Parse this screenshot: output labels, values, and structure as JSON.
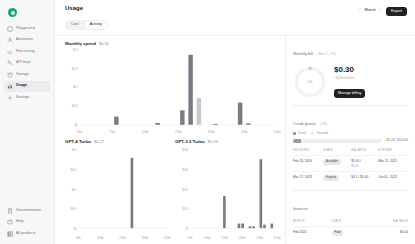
{
  "sidebar": {
    "logo_name": "openai-logo",
    "items": [
      {
        "label": "Playground",
        "icon": "playground-icon",
        "active": false
      },
      {
        "label": "Assistants",
        "icon": "assistants-icon",
        "active": false
      },
      {
        "label": "Fine-tuning",
        "icon": "fine-tuning-icon",
        "active": false
      },
      {
        "label": "API keys",
        "icon": "api-keys-icon",
        "active": false
      },
      {
        "label": "Storage",
        "icon": "storage-icon",
        "active": false
      },
      {
        "label": "Usage",
        "icon": "usage-icon",
        "active": true
      },
      {
        "label": "Settings",
        "icon": "settings-icon",
        "active": false
      }
    ],
    "bottom_items": [
      {
        "label": "Documentation",
        "icon": "documentation-icon"
      },
      {
        "label": "Help",
        "icon": "help-icon"
      },
      {
        "label": "All products",
        "icon": "all-products-icon"
      }
    ]
  },
  "header": {
    "title": "Usage",
    "tabs": [
      {
        "label": "Cost",
        "active": false
      },
      {
        "label": "Activity",
        "active": true
      }
    ],
    "month": "March",
    "prev_label": "‹",
    "next_label": "›",
    "export_label": "Export"
  },
  "billing": {
    "current_bill_title": "Monthly bill",
    "current_bill_period": "(Mar 1 – 31)",
    "amount": "$0.30",
    "note": "* $150.00 limit",
    "manage_label": "Manage billing",
    "donut_percent": "0%",
    "donut_value": 0.2,
    "credit_title": "Credit grants",
    "credit_info": "(US)",
    "legend": [
      {
        "label": "Used",
        "color": "#9a9aa6"
      },
      {
        "label": "Granted",
        "color": "#ececf1"
      }
    ],
    "progress_percent": 9,
    "progress_text": "$1.20 / $13.00",
    "credit_table": {
      "headers": [
        "RECEIVED",
        "STATE",
        "BALANCE",
        "EXPIRES"
      ],
      "rows": [
        {
          "received": "Feb 20, 2024",
          "state": "Available",
          "balance": "$5.00 /",
          "balance_sub": "$5.00",
          "expires": "Mar 11, 2025"
        },
        {
          "received": "Mar 17, 2023",
          "state": "Expired",
          "balance": "$4.1 / $5.00",
          "balance_sub": "",
          "expires": "Jun 01, 2023"
        }
      ]
    },
    "invoices_title": "Invoices",
    "invoices_table": {
      "headers": [
        "MONTH",
        "STATE",
        "BALANCE"
      ],
      "rows": [
        {
          "month": "Feb 2024",
          "state": "Paid",
          "balance": "$0.00"
        }
      ]
    }
  },
  "chart_data": [
    {
      "type": "bar",
      "title": "Monthly spend",
      "total": "$0.30",
      "categories": [
        "1 Mar",
        "5 Mar",
        "10 Mar",
        "15 Mar",
        "20 Mar",
        "25 Mar",
        "31 Mar"
      ],
      "x": [
        4,
        9,
        12,
        13,
        14,
        16,
        19,
        20
      ],
      "values": [
        0.035,
        0.008,
        0.062,
        0.3,
        0.115,
        0.004,
        0.095,
        0.006
      ],
      "highlight_index": 4,
      "ytick_labels": [
        "$0",
        "$0.08",
        "$0.2",
        "$0.23",
        "$0.3"
      ],
      "ylim": [
        0,
        0.32
      ],
      "xlabel": "",
      "ylabel": "",
      "grid": false
    },
    {
      "type": "bar",
      "title": "GPT-4 Turbo",
      "total": "$0.27",
      "categories": [
        "1 Mar",
        "10 Mar",
        "15 Mar",
        "20 Mar",
        "31 Mar"
      ],
      "x": [
        14
      ],
      "values": [
        0.27
      ],
      "ytick_labels": [
        "$0",
        "$0.07",
        "$0.1",
        "$0.14",
        "$0.3"
      ],
      "ylim": [
        0,
        0.3
      ],
      "xlabel": "",
      "ylabel": "",
      "grid": false
    },
    {
      "type": "bar",
      "title": "GPT-3.5 Turbo",
      "total": "$0.03",
      "categories": [
        "1 Mar",
        "10 Mar",
        "15 Mar",
        "20 Mar",
        "25 Mar",
        "31 Mar"
      ],
      "x": [
        9,
        13,
        14,
        16,
        17,
        19,
        20,
        22
      ],
      "values": [
        0.014,
        0.002,
        0.002,
        0.0008,
        0.0008,
        0.03,
        0.0015,
        0.002
      ],
      "ytick_labels": [
        "$0",
        "$0.01",
        "$0.02",
        "$0.03",
        "$0.04"
      ],
      "ylim": [
        0,
        0.034
      ],
      "xlabel": "",
      "ylabel": "",
      "grid": false
    }
  ]
}
